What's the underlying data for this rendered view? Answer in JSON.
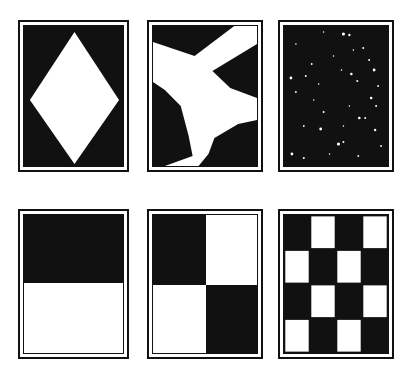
{
  "figure": {
    "colors": {
      "ink": "#111111",
      "paper": "#ffffff"
    },
    "cards": [
      {
        "id": "diamond",
        "row": 1,
        "col": 1,
        "pattern": "white-diamond-on-black"
      },
      {
        "id": "airplane",
        "row": 1,
        "col": 2,
        "pattern": "white-airplane-silhouette-on-black"
      },
      {
        "id": "starfield",
        "row": 1,
        "col": 3,
        "pattern": "scattered-white-speckles-on-black"
      },
      {
        "id": "half-split",
        "row": 2,
        "col": 1,
        "pattern": "black-top-half-white-bottom-half"
      },
      {
        "id": "quadrants",
        "row": 2,
        "col": 2,
        "pattern": "2x2-checkerboard"
      },
      {
        "id": "checkerboard",
        "row": 2,
        "col": 3,
        "pattern": "4x4-checkerboard"
      }
    ]
  }
}
